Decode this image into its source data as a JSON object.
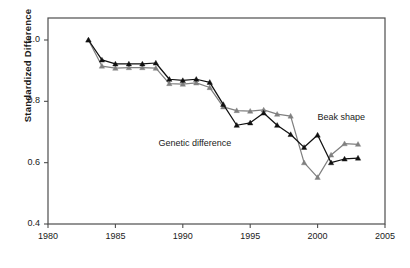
{
  "chart_data": {
    "type": "line",
    "title": "",
    "subtitle": "",
    "xlabel": "",
    "ylabel": "Standardized  Difference",
    "xlim": [
      1980,
      2005
    ],
    "ylim": [
      0.4,
      1.05
    ],
    "xticks": [
      1980,
      1985,
      1990,
      1995,
      2000,
      2005
    ],
    "xtick_labels": [
      "1980",
      "1985",
      "1990",
      "1995",
      "2000",
      "2005"
    ],
    "yticks": [
      0.4,
      0.6,
      0.8,
      1.0
    ],
    "ytick_labels": [
      "0.4",
      "0.6",
      "0.8",
      "1.0"
    ],
    "grid": false,
    "legend_position": "inline-annotations",
    "x": [
      1983,
      1984,
      1985,
      1986,
      1987,
      1988,
      1989,
      1990,
      1991,
      1992,
      1993,
      1994,
      1995,
      1996,
      1997,
      1998,
      1999,
      2000,
      2001,
      2002,
      2003
    ],
    "series": [
      {
        "name": "Beak shape",
        "color": "#808080",
        "marker": "triangle",
        "values": [
          1.0,
          0.915,
          0.908,
          0.91,
          0.91,
          0.908,
          0.858,
          0.856,
          0.86,
          0.845,
          0.782,
          0.77,
          0.768,
          0.772,
          0.758,
          0.752,
          0.6,
          0.552,
          0.625,
          0.662,
          0.66
        ]
      },
      {
        "name": "Genetic difference",
        "color": "#111111",
        "marker": "triangle",
        "values": [
          1.0,
          0.935,
          0.922,
          0.922,
          0.922,
          0.925,
          0.872,
          0.868,
          0.872,
          0.862,
          0.79,
          0.722,
          0.73,
          0.762,
          0.722,
          0.692,
          0.65,
          0.69,
          0.6,
          0.612,
          0.615
        ]
      }
    ],
    "annotations": [
      {
        "text": "Beak shape",
        "x": 2000.0,
        "y": 0.745
      },
      {
        "text": "Genetic difference",
        "x": 1993.6,
        "y": 0.662
      }
    ]
  },
  "axes": {
    "frame_color": "#4d4d4d",
    "tick_color": "#4d4d4d"
  }
}
